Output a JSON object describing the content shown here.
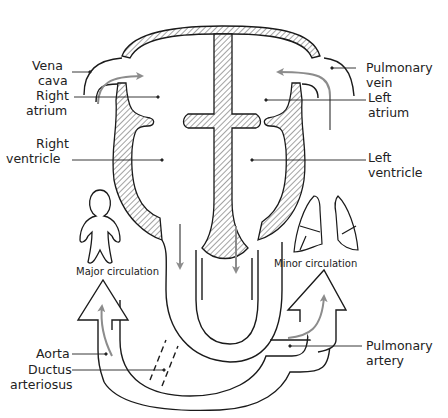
{
  "diagram": {
    "colors": {
      "stroke": "#1a1a1a",
      "flow_arrow": "#8c8c8c",
      "background": "#ffffff"
    },
    "labels_left": [
      {
        "id": "vena-cava",
        "line1": "Vena",
        "line2": "cava"
      },
      {
        "id": "right-atrium",
        "line1": "Right",
        "line2": "atrium"
      },
      {
        "id": "right-ventricle",
        "line1": "Right",
        "line2": "ventricle"
      },
      {
        "id": "aorta",
        "line1": "Aorta",
        "line2": ""
      },
      {
        "id": "ductus-arteriosus",
        "line1": "Ductus",
        "line2": "arteriosus"
      }
    ],
    "labels_right": [
      {
        "id": "pulmonary-vein",
        "line1": "Pulmonary",
        "line2": "vein"
      },
      {
        "id": "left-atrium",
        "line1": "Left",
        "line2": "atrium"
      },
      {
        "id": "left-ventricle",
        "line1": "Left",
        "line2": "ventricle"
      },
      {
        "id": "pulmonary-artery",
        "line1": "Pulmonary",
        "line2": "artery"
      }
    ],
    "captions": {
      "major": "Major circulation",
      "minor": "Minor circulation"
    },
    "icons": [
      "human-figure-icon",
      "lungs-icon",
      "major-circulation-arrow-icon",
      "minor-circulation-arrow-icon"
    ]
  }
}
